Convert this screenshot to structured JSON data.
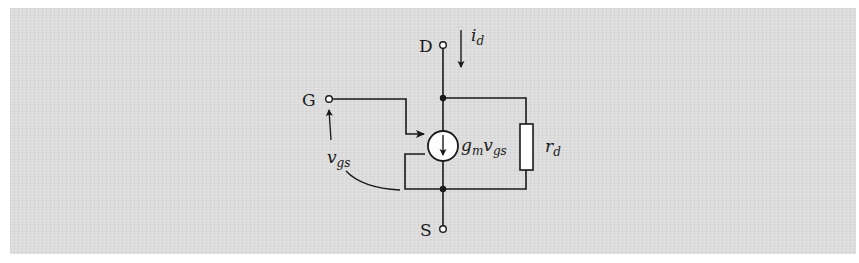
{
  "diagram": {
    "type": "circuit",
    "title": "",
    "terminals": {
      "drain": "D",
      "gate": "G",
      "source": "S"
    },
    "labels": {
      "drain_current": {
        "main": "i",
        "sub": "d"
      },
      "gate_source_voltage": {
        "main": "v",
        "sub": "gs"
      },
      "current_source": {
        "g": "g",
        "g_sub": "m",
        "v": "v",
        "v_sub": "gs"
      },
      "resistor": {
        "main": "r",
        "sub": "d"
      }
    },
    "colors": {
      "background": "#dcdcdc",
      "stroke": "#1a1a1a",
      "fill_component": "#ffffff"
    }
  }
}
